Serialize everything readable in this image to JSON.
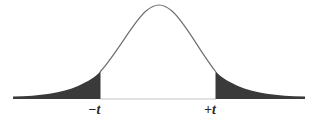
{
  "diagram": {
    "type": "two-tailed t-distribution",
    "labels": {
      "left_critical": "−t",
      "right_critical": "+t"
    },
    "colors": {
      "curve": "#6e6e6e",
      "shaded_tails": "#3a3a3a",
      "baseline": "#bdbdbd",
      "background": "#ffffff"
    }
  }
}
